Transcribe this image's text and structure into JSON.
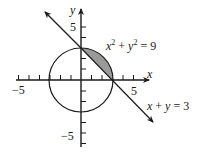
{
  "diagram": {
    "type": "coordinate-plane",
    "x_axis": {
      "label": "x",
      "tick_label_neg": "−5",
      "tick_label_pos": "5",
      "range": [
        -6,
        6
      ]
    },
    "y_axis": {
      "label": "y",
      "tick_label_pos": "5",
      "tick_label_neg": "−5",
      "range": [
        -6,
        6
      ]
    },
    "circle": {
      "equation_label": "x² + y² = 9",
      "center": [
        0,
        0
      ],
      "radius": 3
    },
    "line": {
      "equation_label": "x + y = 3",
      "intercepts": [
        [
          3,
          0
        ],
        [
          0,
          3
        ]
      ]
    },
    "shaded_region": {
      "description": "segment of circle between arc and line in quadrant I",
      "fill": "#9a9a9a"
    }
  },
  "labels": {
    "x": "x",
    "y": "y",
    "x_neg5": "−5",
    "x_pos5": "5",
    "y_pos5": "5",
    "y_neg5": "−5",
    "circle_eq_x": "x",
    "circle_eq_sup1": "2",
    "circle_eq_mid": " + ",
    "circle_eq_y": "y",
    "circle_eq_sup2": "2",
    "circle_eq_end": " = 9",
    "line_eq_x": "x",
    "line_eq_mid": " + ",
    "line_eq_y": "y",
    "line_eq_end": " = 3"
  },
  "colors": {
    "stroke": "#1a1a1a",
    "shade": "#9a9a9a",
    "background": "#ffffff"
  }
}
